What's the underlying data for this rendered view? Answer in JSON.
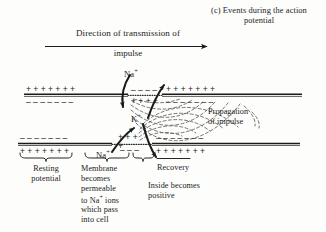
{
  "figure": {
    "caption": "(c) Events during the action potential",
    "direction_label_line1": "Direction of transmission of",
    "direction_label_line2": "impulse",
    "arrow_name": "direction-of-transmission-arrow"
  },
  "ions": {
    "sodium_top": "Na",
    "sodium_top_charge": "+",
    "potassium": "K",
    "potassium_charge": "+",
    "sodium_bottom": "Na",
    "sodium_bottom_charge": "+"
  },
  "labels": {
    "propagation_line1": "Propagation",
    "propagation_line2": "of impulse",
    "resting_line1": "Resting",
    "resting_line2": "potential",
    "membrane_line1": "Membrane",
    "membrane_line2": "becomes",
    "membrane_line3": "permeable",
    "membrane_line4a": "to Na",
    "membrane_line4b": " ions",
    "membrane_line5": "which pass",
    "membrane_line6": "into cell",
    "recovery": "Recovery",
    "inside_line1": "Inside becomes",
    "inside_line2": "positive"
  },
  "membrane": {
    "top": {
      "left_outside_charges": "+ + + + + + +",
      "left_inside_charges": "– – – – – – –",
      "mid_outside_charges": "– – – –",
      "mid_inside_charges": "+ + + +",
      "right_outside_charges": "+ + + + + + +",
      "right_inside_charges": "– – – – – – –"
    },
    "bottom": {
      "left_outside_charges": "– – – – – – –",
      "left_inside_charges": "+ + + + + + +",
      "mid_outside_charges": "+ + + +",
      "mid_inside_charges": "– – –",
      "right_outside_charges": "– – – – – – –",
      "right_inside_charges": "+ + + + + + +"
    }
  },
  "colors": {
    "ink": "#1b1b1b",
    "background": "#fdfdfb",
    "field_lines": "#5a5a5a"
  }
}
